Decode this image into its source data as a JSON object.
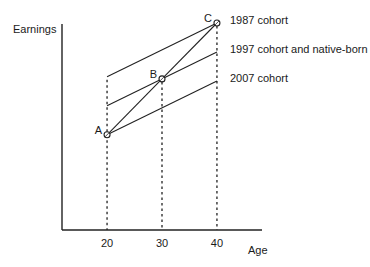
{
  "chart_data": {
    "type": "line",
    "title": "",
    "xlabel": "Age",
    "ylabel": "Earnings",
    "xlim": [
      11.8,
      48.2
    ],
    "ylim": [
      0,
      100
    ],
    "x_ticks": [
      20,
      30,
      40
    ],
    "x_tick_labels": [
      "20",
      "30",
      "40"
    ],
    "grid": false,
    "series": [
      {
        "name": "1987 cohort",
        "x": [
          20,
          40
        ],
        "y": [
          74,
          100
        ]
      },
      {
        "name": "1997 cohort and native-born",
        "x": [
          20,
          40
        ],
        "y": [
          60,
          86
        ]
      },
      {
        "name": "2007 cohort",
        "x": [
          20,
          40
        ],
        "y": [
          46,
          72
        ]
      },
      {
        "name": "A-B-C path",
        "x": [
          20,
          30,
          40
        ],
        "y": [
          46,
          73,
          100
        ]
      }
    ],
    "points": [
      {
        "label": "A",
        "x": 20,
        "y": 46
      },
      {
        "label": "B",
        "x": 30,
        "y": 73
      },
      {
        "label": "C",
        "x": 40,
        "y": 100
      }
    ],
    "guides_at_x": [
      20,
      30,
      40
    ],
    "annotations": [
      {
        "text": "1987 cohort",
        "series": 0
      },
      {
        "text": "1997 cohort and native-born",
        "series": 1
      },
      {
        "text": "2007 cohort",
        "series": 2
      }
    ]
  }
}
